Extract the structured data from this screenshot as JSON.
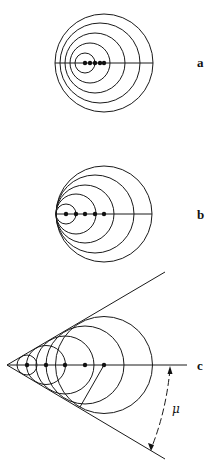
{
  "diagram": {
    "panels": [
      {
        "label": "a",
        "axis_y": 63,
        "line_x": [
          55,
          153
        ],
        "circles": [
          {
            "cx": 85,
            "r": 10
          },
          {
            "cx": 90,
            "r": 20
          },
          {
            "cx": 95,
            "r": 30
          },
          {
            "cx": 100,
            "r": 40
          },
          {
            "cx": 104,
            "r": 49
          }
        ],
        "dots": [
          85,
          90,
          95,
          100,
          104
        ]
      },
      {
        "label": "b",
        "axis_y": 214,
        "line_x": [
          56,
          152
        ],
        "circles": [
          {
            "cx": 66,
            "r": 10
          },
          {
            "cx": 76,
            "r": 20
          },
          {
            "cx": 85,
            "r": 29
          },
          {
            "cx": 95,
            "r": 39
          },
          {
            "cx": 104,
            "r": 48
          }
        ],
        "dots": [
          66,
          76,
          85,
          95,
          104
        ]
      },
      {
        "label": "c",
        "axis_y": 365,
        "apex": [
          7,
          365
        ],
        "line_x": [
          7,
          187
        ],
        "cone_upper_end": [
          165,
          272
        ],
        "cone_lower_end": [
          165,
          459
        ],
        "circles": [
          {
            "cx": 27,
            "r": 10
          },
          {
            "cx": 46,
            "r": 19.5
          },
          {
            "cx": 65,
            "r": 29
          },
          {
            "cx": 85,
            "r": 39
          },
          {
            "cx": 104,
            "r": 48.5
          }
        ],
        "dots": [
          27,
          46,
          65,
          85,
          104
        ],
        "angle_symbol": "μ"
      }
    ]
  }
}
